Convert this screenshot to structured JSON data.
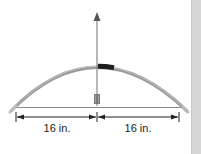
{
  "diagram": {
    "measurements": [
      {
        "label": "16 in.",
        "segment": "left half of bowstring"
      },
      {
        "label": "16 in.",
        "segment": "right half of bowstring"
      }
    ],
    "colors": {
      "bow": "#9a9a9a",
      "bow_highlight": "#c4c4c4",
      "grip": "#1e1e1e",
      "arrow": "#777777",
      "string": "#8a8a8a",
      "dimension_line": "#222222",
      "side_strip": "#d6d6d6"
    }
  }
}
